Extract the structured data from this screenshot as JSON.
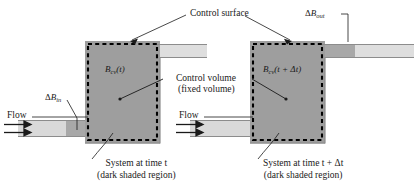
{
  "figure": {
    "colors": {
      "system_fill": "#9e9e9e",
      "pipe_fill": "#d9d9d9",
      "pipe_dark_fill": "#a8a8a8",
      "outline": "#8c8c8c",
      "control_surface": "#000000",
      "text": "#1a1a1a"
    }
  },
  "annotations": {
    "control_surface": "Control surface",
    "control_volume_line1": "Control volume",
    "control_volume_line2": "(fixed volume)",
    "delta_b_in": {
      "delta": "Δ",
      "symbol": "B",
      "subscript": "in"
    },
    "delta_b_out": {
      "delta": "Δ",
      "symbol": "B",
      "subscript": "out"
    }
  },
  "left_panel": {
    "flow_label": "Flow",
    "cv_symbol": {
      "symbol": "B",
      "subscript": "cv",
      "argument": "(t)"
    },
    "caption_line1": "System at time t",
    "caption_line2": "(dark shaded region)",
    "arrow_count": 2
  },
  "right_panel": {
    "flow_label": "Flow",
    "cv_symbol": {
      "symbol": "B",
      "subscript": "cv",
      "argument": "(t + Δt)"
    },
    "caption_line1": "System at time t + Δt",
    "caption_line2": "(dark shaded region)",
    "arrow_count": 2
  }
}
